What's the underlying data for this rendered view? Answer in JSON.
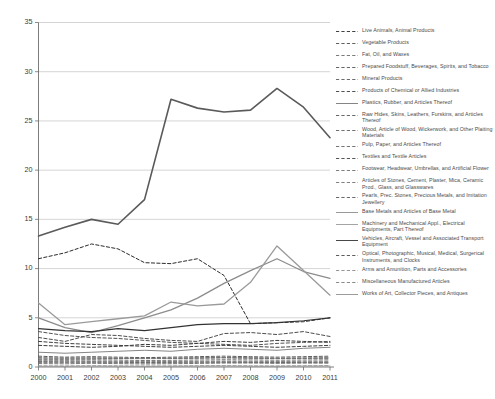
{
  "chart_data": {
    "type": "line",
    "title": "",
    "xlabel": "",
    "ylabel": "",
    "x": [
      2000,
      2001,
      2002,
      2003,
      2004,
      2005,
      2006,
      2007,
      2008,
      2009,
      2010,
      2011
    ],
    "xlim": [
      2000,
      2011
    ],
    "ylim": [
      0,
      35
    ],
    "yticks": [
      0,
      5,
      10,
      15,
      20,
      25,
      30,
      35
    ],
    "xticks": [
      "2000",
      "2001",
      "2002",
      "2003",
      "2004",
      "2005",
      "2006",
      "2007",
      "2008",
      "2009",
      "2010",
      "2011"
    ],
    "grid": "horizontal",
    "legend_position": "right",
    "series": [
      {
        "name": "Live Animals, Animal Products",
        "style": "dashed",
        "color": "#2b2b2b",
        "width": 1.0,
        "values": [
          11.0,
          11.6,
          12.5,
          12.0,
          10.6,
          10.5,
          11.0,
          9.3,
          4.4,
          4.5,
          4.6,
          5.0
        ]
      },
      {
        "name": "Vegetable Products",
        "style": "dashed",
        "color": "#4d4d4d",
        "width": 1.0,
        "values": [
          3.0,
          2.6,
          3.3,
          3.2,
          2.9,
          2.7,
          2.6,
          3.4,
          3.5,
          3.3,
          3.6,
          3.1
        ]
      },
      {
        "name": "Fat, Oil, and Waxes",
        "style": "dashed",
        "color": "#6b6b6b",
        "width": 0.9,
        "values": [
          0.35,
          0.32,
          0.38,
          0.34,
          0.3,
          0.33,
          0.36,
          0.4,
          0.42,
          0.38,
          0.41,
          0.39
        ]
      },
      {
        "name": "Prepared Foodstuff, Beverages, Spirits, and Tobacco",
        "style": "dashed",
        "color": "#545454",
        "width": 1.0,
        "values": [
          3.6,
          3.2,
          3.0,
          2.9,
          2.7,
          2.5,
          2.4,
          2.3,
          2.2,
          2.4,
          2.5,
          2.6
        ]
      },
      {
        "name": "Mineral Products",
        "style": "solid",
        "color": "#5a5a5a",
        "width": 1.6,
        "values": [
          13.3,
          14.2,
          15.0,
          14.5,
          17.0,
          27.2,
          26.3,
          25.9,
          26.1,
          28.3,
          26.4,
          23.3
        ]
      },
      {
        "name": "Products of Chemical or Allied Industries",
        "style": "dashed",
        "color": "#3c3c3c",
        "width": 1.0,
        "values": [
          2.2,
          2.1,
          2.0,
          2.1,
          2.3,
          2.2,
          2.4,
          2.6,
          2.5,
          2.7,
          2.6,
          2.5
        ]
      },
      {
        "name": "Plastics, Rubber, and Articles Thereof",
        "style": "solid",
        "color": "#777777",
        "width": 0.9,
        "values": [
          1.5,
          1.4,
          1.5,
          1.6,
          1.7,
          1.6,
          1.8,
          1.9,
          1.8,
          1.7,
          1.9,
          2.0
        ]
      },
      {
        "name": "Raw Hides, Skins, Leathers, Furskins, and Articles Thereof",
        "style": "dashed",
        "color": "#555555",
        "width": 0.9,
        "values": [
          0.55,
          0.5,
          0.52,
          0.48,
          0.45,
          0.47,
          0.5,
          0.52,
          0.49,
          0.46,
          0.48,
          0.5
        ]
      },
      {
        "name": "Wood, Article of Wood, Wickerwork, and Other Plaiting Materials",
        "style": "dashed",
        "color": "#606060",
        "width": 0.9,
        "values": [
          0.95,
          0.9,
          0.92,
          0.88,
          0.85,
          0.87,
          0.9,
          0.95,
          0.92,
          0.88,
          0.9,
          0.93
        ]
      },
      {
        "name": "Pulp, Paper, and Articles Thereof",
        "style": "dashed",
        "color": "#646464",
        "width": 0.9,
        "values": [
          0.7,
          0.68,
          0.72,
          0.7,
          0.66,
          0.68,
          0.71,
          0.74,
          0.72,
          0.69,
          0.71,
          0.73
        ]
      },
      {
        "name": "Textiles and Textile Articles",
        "style": "dashed",
        "color": "#3f3f3f",
        "width": 1.0,
        "values": [
          2.6,
          2.4,
          2.3,
          2.2,
          2.1,
          2.0,
          2.1,
          2.2,
          2.1,
          2.0,
          2.1,
          2.2
        ]
      },
      {
        "name": "Footwear, Headwear, Umbrellas, and Artificial Flower",
        "style": "dashed",
        "color": "#6e6e6e",
        "width": 0.9,
        "values": [
          0.45,
          0.43,
          0.44,
          0.42,
          0.4,
          0.41,
          0.43,
          0.45,
          0.43,
          0.41,
          0.43,
          0.44
        ]
      },
      {
        "name": "Articles of Stones, Cement, Plaster, Mica, Ceramic Prod., Glass, and Glasswares",
        "style": "dashed",
        "color": "#727272",
        "width": 0.9,
        "values": [
          0.6,
          0.58,
          0.59,
          0.57,
          0.55,
          0.56,
          0.58,
          0.6,
          0.58,
          0.56,
          0.58,
          0.59
        ]
      },
      {
        "name": "Pearls, Prec. Stones, Precious Metals, and Imitation Jewellery",
        "style": "dashed",
        "color": "#585858",
        "width": 0.9,
        "values": [
          0.8,
          0.78,
          0.82,
          0.85,
          0.9,
          0.88,
          0.92,
          0.95,
          0.9,
          0.86,
          0.88,
          0.9
        ]
      },
      {
        "name": "Base Metals and Articles of Base Metal",
        "style": "solid",
        "color": "#8c8c8c",
        "width": 1.3,
        "values": [
          5.0,
          4.0,
          3.5,
          4.2,
          5.0,
          5.8,
          7.0,
          8.5,
          9.8,
          11.0,
          9.7,
          9.0
        ]
      },
      {
        "name": "Machinery and Mechanical Appl., Electrical Equipments, Part Thereof",
        "style": "solid",
        "color": "#9a9a9a",
        "width": 1.3,
        "values": [
          6.5,
          4.3,
          4.6,
          4.9,
          5.2,
          6.6,
          6.2,
          6.4,
          8.6,
          12.3,
          9.8,
          7.3
        ]
      },
      {
        "name": "Vehicles, Aircraft, Vessel and Associated Transport Equipment",
        "style": "solid",
        "color": "#333333",
        "width": 1.2,
        "values": [
          3.9,
          3.7,
          3.6,
          3.9,
          3.7,
          4.0,
          4.3,
          4.4,
          4.4,
          4.5,
          4.7,
          5.0
        ]
      },
      {
        "name": "Optical, Photographic, Musical, Medical, Surgerical Instruments, and Clocks",
        "style": "dashed",
        "color": "#4a4a4a",
        "width": 0.9,
        "values": [
          1.1,
          1.0,
          1.05,
          1.0,
          0.95,
          1.0,
          1.05,
          1.1,
          1.05,
          1.0,
          1.05,
          1.1
        ]
      },
      {
        "name": "Arms and Amunition, Parts and Accessories",
        "style": "dashed",
        "color": "#8a8a8a",
        "width": 0.8,
        "values": [
          0.12,
          0.11,
          0.13,
          0.12,
          0.1,
          0.11,
          0.13,
          0.14,
          0.12,
          0.11,
          0.13,
          0.14
        ]
      },
      {
        "name": "Miscellaneous Manufactured Articles",
        "style": "dashed",
        "color": "#7c7c7c",
        "width": 0.9,
        "values": [
          0.9,
          0.88,
          0.92,
          0.9,
          0.86,
          0.88,
          0.91,
          0.94,
          0.91,
          0.88,
          0.9,
          0.92
        ]
      },
      {
        "name": "Works of Art, Collector Pieces, and Antiques",
        "style": "solid",
        "color": "#909090",
        "width": 0.8,
        "values": [
          0.08,
          0.07,
          0.09,
          0.08,
          0.07,
          0.08,
          0.09,
          0.1,
          0.08,
          0.07,
          0.09,
          0.1
        ]
      }
    ]
  },
  "legend": {
    "items": [
      {
        "label": "Live Animals, Animal Products",
        "style": "dashed",
        "color": "#2b2b2b"
      },
      {
        "label": "Vegetable Products",
        "style": "dashed",
        "color": "#4d4d4d"
      },
      {
        "label": "Fat, Oil, and Waxes",
        "style": "dashed",
        "color": "#6b6b6b"
      },
      {
        "label": "Prepared Foodstuff, Beverages, Spirits, and Tobacco",
        "style": "dashed",
        "color": "#545454"
      },
      {
        "label": "Mineral Products",
        "style": "dashed",
        "color": "#5a5a5a"
      },
      {
        "label": "Products of Chemical or Allied Industries",
        "style": "dashed",
        "color": "#3c3c3c"
      },
      {
        "label": "Plastics, Rubber, and Articles Thereof",
        "style": "solid",
        "color": "#777777"
      },
      {
        "label": "Raw Hides, Skins, Leathers, Furskins, and Articles Thereof",
        "style": "dashed",
        "color": "#555555"
      },
      {
        "label": "Wood, Article of Wood, Wickerwork, and Other Plaiting Materials",
        "style": "dashed",
        "color": "#606060"
      },
      {
        "label": "Pulp, Paper, and Articles Thereof",
        "style": "dashed",
        "color": "#646464"
      },
      {
        "label": "Textiles and Textile Articles",
        "style": "dashed",
        "color": "#3f3f3f"
      },
      {
        "label": "Footwear, Headwear, Umbrellas, and Artificial Flower",
        "style": "dashed",
        "color": "#6e6e6e"
      },
      {
        "label": "Articles of Stones, Cement, Plaster, Mica, Ceramic Prod., Glass, and Glasswares",
        "style": "dashed",
        "color": "#727272"
      },
      {
        "label": "Pearls, Prec. Stones, Precious Metals, and Imitation Jewellery",
        "style": "dashed",
        "color": "#585858"
      },
      {
        "label": "Base Metals and Articles of Base Metal",
        "style": "solid",
        "color": "#8c8c8c"
      },
      {
        "label": "Machinery and Mechanical Appl., Electrical Equipments, Part Thereof",
        "style": "solid",
        "color": "#9a9a9a"
      },
      {
        "label": "Vehicles, Aircraft, Vessel and Associated Transport Equipment",
        "style": "solid",
        "color": "#333333"
      },
      {
        "label": "Optical, Photographic, Musical, Medical, Surgerical Instruments, and Clocks",
        "style": "dashed",
        "color": "#4a4a4a"
      },
      {
        "label": "Arms and Amunition, Parts and Accessories",
        "style": "dashed",
        "color": "#8a8a8a"
      },
      {
        "label": "Miscellaneous Manufactured Articles",
        "style": "dashed",
        "color": "#7c7c7c"
      },
      {
        "label": "Works of Art, Collector Pieces, and Antiques",
        "style": "solid",
        "color": "#909090"
      }
    ]
  }
}
